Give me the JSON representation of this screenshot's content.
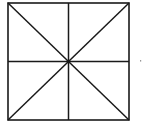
{
  "diagram": {
    "stroke_color": "#1a1a1a",
    "background_color": "#ffffff",
    "elements": [
      {
        "name": "outer-square",
        "kind": "square"
      },
      {
        "name": "diagonal-top-left-to-bottom-right",
        "kind": "line"
      },
      {
        "name": "diagonal-top-right-to-bottom-left",
        "kind": "line"
      },
      {
        "name": "vertical-midline",
        "kind": "line"
      },
      {
        "name": "horizontal-midline",
        "kind": "line"
      },
      {
        "name": "stray-dot",
        "kind": "dot"
      }
    ]
  }
}
